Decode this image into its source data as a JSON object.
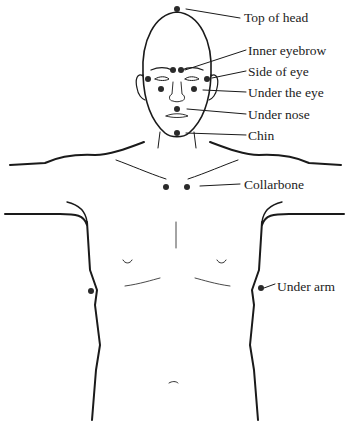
{
  "diagram": {
    "points": [
      {
        "id": "top-of-head",
        "label": "Top of head"
      },
      {
        "id": "inner-eyebrow",
        "label": "Inner eyebrow"
      },
      {
        "id": "side-of-eye",
        "label": "Side of eye"
      },
      {
        "id": "under-the-eye",
        "label": "Under the eye"
      },
      {
        "id": "under-nose",
        "label": "Under nose"
      },
      {
        "id": "chin",
        "label": "Chin"
      },
      {
        "id": "collarbone",
        "label": "Collarbone"
      },
      {
        "id": "under-arm",
        "label": "Under arm"
      }
    ],
    "colors": {
      "line": "#1a1a1a",
      "dot": "#2a2a2a",
      "text": "#222222"
    }
  }
}
